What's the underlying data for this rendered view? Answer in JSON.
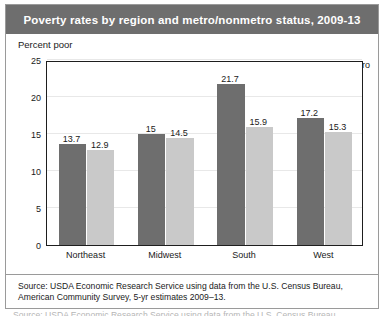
{
  "title": "Poverty rates by region and metro/nonmetro status, 2009-13",
  "axis_caption": "Percent poor",
  "legend": {
    "nonmetro_label": "Nonmetro",
    "metro_label": "Metro"
  },
  "source_note": "Source: USDA Economic Research Service using data from the U.S. Census Bureau, American Community Survey, 5-yr estimates 2009–13.",
  "cutoff_note": "Source: USDA Economic Research Service using data from the U.S. Census Bureau,",
  "colors": {
    "nonmetro": "#6e6e6e",
    "metro": "#c9c9c9",
    "title_bar": "#6e6e6e",
    "title_text": "#ffffff",
    "frame": "#9a9a9a",
    "axis": "#1e1e1e",
    "gridline": "#e8e8e8"
  },
  "chart_data": {
    "type": "bar",
    "title": "Poverty rates by region and metro/nonmetro status, 2009-13",
    "xlabel": "",
    "ylabel": "Percent poor",
    "categories": [
      "Northeast",
      "Midwest",
      "South",
      "West"
    ],
    "series": [
      {
        "name": "Nonmetro",
        "color": "#6e6e6e",
        "values": [
          13.7,
          15,
          21.7,
          17.2
        ],
        "labels": [
          "13.7",
          "15",
          "21.7",
          "17.2"
        ]
      },
      {
        "name": "Metro",
        "color": "#c9c9c9",
        "values": [
          12.9,
          14.5,
          15.9,
          15.3
        ],
        "labels": [
          "12.9",
          "14.5",
          "15.9",
          "15.3"
        ]
      }
    ],
    "ylim": [
      0,
      25
    ],
    "yticks": [
      0,
      5,
      10,
      15,
      20,
      25
    ],
    "ytick_labels": [
      "0",
      "5",
      "10",
      "15",
      "20",
      "25"
    ],
    "grid": true,
    "legend_position": "top-right"
  }
}
